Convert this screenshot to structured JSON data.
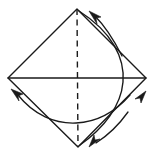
{
  "figure": {
    "canvas": {
      "width": 154,
      "height": 155
    },
    "background_color": "#ffffff",
    "line_color": "#1a1a1a"
  },
  "shape": {
    "name": "diamond",
    "type": "polygon",
    "vertices": {
      "top": {
        "x": 77,
        "y": 9
      },
      "right": {
        "x": 146,
        "y": 78
      },
      "bottom": {
        "x": 78,
        "y": 147
      },
      "left": {
        "x": 8,
        "y": 78
      }
    },
    "points_attr": "77,9 146,78 78,147 8,78"
  },
  "lines": [
    {
      "name": "vertical-fold-line",
      "style": "dashed",
      "from": {
        "x": 77,
        "y": 9
      },
      "to": {
        "x": 78,
        "y": 147
      },
      "path_attr": "M 77 9 L 78 147"
    },
    {
      "name": "horizontal-center-line",
      "style": "solid",
      "from": {
        "x": 8,
        "y": 78
      },
      "to": {
        "x": 146,
        "y": 78
      },
      "path_attr": "M 8 78 L 146 78"
    }
  ],
  "arcs": [
    {
      "name": "right-bulge-arc",
      "description": "Large arc from top vertex bulging right down to bottom vertex",
      "path_attr": "M 79 11 C 112 32 125 58 123 82 C 121 106 104 128 80 145"
    },
    {
      "name": "lower-sweep-arc",
      "description": "Arc sweeping across the lower half from left edge to lower right",
      "path_attr": "M 18 95 C 34 115 55 124 76 123 C 98 122 116 111 130 95"
    },
    {
      "name": "top-arrow-arc",
      "description": "Short curved arc leading into the top arrowhead",
      "path_attr": "M 122 56 C 113 38 104 25 94 15"
    },
    {
      "name": "bottom-right-arrow-arc",
      "description": "Curved arc from lower-right edge down toward bottom arrowhead",
      "path_attr": "M 128 112 C 118 126 107 136 96 143"
    }
  ],
  "arrows": [
    {
      "name": "top-arrow",
      "direction": "up-left",
      "meaning": "fold up toward apex",
      "tip": {
        "x": 89,
        "y": 11
      },
      "head_points": "89,11 101,17 96,18 97,24"
    },
    {
      "name": "left-arrow",
      "direction": "up-left",
      "meaning": "fold up toward left",
      "tip": {
        "x": 11,
        "y": 89
      },
      "head_points": "11,89 23,94 18,96 19,101"
    },
    {
      "name": "right-arrow",
      "direction": "up-right",
      "meaning": "unfold to the right",
      "tip": {
        "x": 146,
        "y": 91
      },
      "head_points": "146,91 141,103 140,98 135,99"
    },
    {
      "name": "bottom-right-arrow",
      "direction": "down-left",
      "meaning": "fold down to the left",
      "tip": {
        "x": 89,
        "y": 147
      },
      "head_points": "89,147 94,135 95,140 100,139"
    }
  ]
}
